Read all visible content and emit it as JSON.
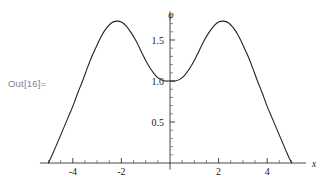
{
  "cell": {
    "out_label": "Out[16]="
  },
  "chart_data": {
    "type": "line",
    "title": "",
    "xlabel": "x",
    "ylabel": "φ",
    "xlim": [
      -5.35,
      5.6
    ],
    "ylim": [
      -0.08,
      1.85
    ],
    "grid": false,
    "legend": null,
    "xticks": [
      -4,
      -2,
      2,
      4
    ],
    "xtick_labels": [
      "-4",
      "-2",
      "2",
      "4"
    ],
    "xminor_step": 0.5,
    "yticks": [
      0.5,
      1.0,
      1.5
    ],
    "ytick_labels": [
      "0.5",
      "1.0",
      "1.5"
    ],
    "yminor_step": 0.1,
    "series": [
      {
        "name": "phi",
        "color": "#222222",
        "x": [
          -5.0,
          -4.8,
          -4.6,
          -4.4,
          -4.2,
          -4.0,
          -3.8,
          -3.6,
          -3.4,
          -3.2,
          -3.0,
          -2.8,
          -2.6,
          -2.4,
          -2.2,
          -2.0,
          -1.8,
          -1.6,
          -1.4,
          -1.2,
          -1.0,
          -0.8,
          -0.6,
          -0.4,
          -0.2,
          0.0,
          0.2,
          0.4,
          0.6,
          0.8,
          1.0,
          1.2,
          1.4,
          1.6,
          1.8,
          2.0,
          2.2,
          2.4,
          2.6,
          2.8,
          3.0,
          3.2,
          3.4,
          3.6,
          3.8,
          4.0,
          4.2,
          4.4,
          4.6,
          4.8,
          5.0
        ],
        "y": [
          0.0,
          0.13,
          0.27,
          0.41,
          0.55,
          0.69,
          0.85,
          1.0,
          1.16,
          1.31,
          1.44,
          1.56,
          1.65,
          1.71,
          1.73,
          1.72,
          1.67,
          1.59,
          1.49,
          1.37,
          1.25,
          1.15,
          1.07,
          1.02,
          1.0,
          1.0,
          1.0,
          1.02,
          1.07,
          1.15,
          1.25,
          1.37,
          1.49,
          1.59,
          1.67,
          1.72,
          1.73,
          1.71,
          1.65,
          1.56,
          1.44,
          1.31,
          1.16,
          1.0,
          0.85,
          0.69,
          0.55,
          0.41,
          0.27,
          0.13,
          0.0
        ]
      }
    ],
    "annotations": {
      "axis_origin_x": 0,
      "axis_origin_y": 0,
      "local_min_value": 1.0,
      "peak_value": 1.73,
      "peak_positions": [
        -2.2,
        2.2
      ],
      "zero_crossings": [
        -5.0,
        5.0
      ]
    }
  }
}
